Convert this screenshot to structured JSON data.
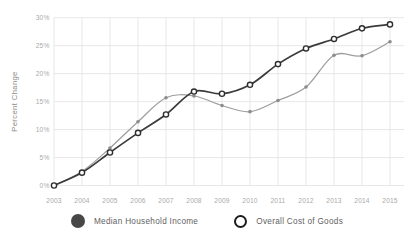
{
  "chart_data": {
    "type": "line",
    "title": "",
    "xlabel": "",
    "ylabel": "Percent Change",
    "x_tick_labels": [
      "2003",
      "2004",
      "2005",
      "2006",
      "2007",
      "2008",
      "2009",
      "2010",
      "2011",
      "2012",
      "2013",
      "2014",
      "2015"
    ],
    "y_ticks": [
      0,
      5,
      10,
      15,
      20,
      25,
      30
    ],
    "y_tick_labels": [
      "0%",
      "5%",
      "10%",
      "15%",
      "20%",
      "25%",
      "30%"
    ],
    "ylim": [
      0,
      30
    ],
    "grid": true,
    "legend_position": "bottom",
    "series": [
      {
        "name": "Median Household Income",
        "marker": "filled-circle",
        "line_color": "#9e9e9e",
        "marker_color": "#8c8c8c",
        "values": [
          0,
          2.5,
          6.7,
          11.4,
          15.7,
          16.0,
          14.3,
          13.2,
          15.2,
          17.6,
          23.3,
          23.2,
          25.7
        ]
      },
      {
        "name": "Overall Cost of Goods",
        "marker": "open-circle",
        "line_color": "#3b3b3b",
        "marker_color": "#2e2e2e",
        "values": [
          0,
          2.3,
          5.9,
          9.4,
          12.7,
          16.8,
          16.4,
          18.0,
          21.7,
          24.5,
          26.2,
          28.1,
          28.8
        ]
      }
    ]
  },
  "legend": {
    "items": [
      {
        "label": "Median Household Income",
        "marker": "filled-circle",
        "marker_color": "#474747"
      },
      {
        "label": "Overall Cost of Goods",
        "marker": "open-circle",
        "marker_color": "#1c1c1c"
      }
    ]
  }
}
